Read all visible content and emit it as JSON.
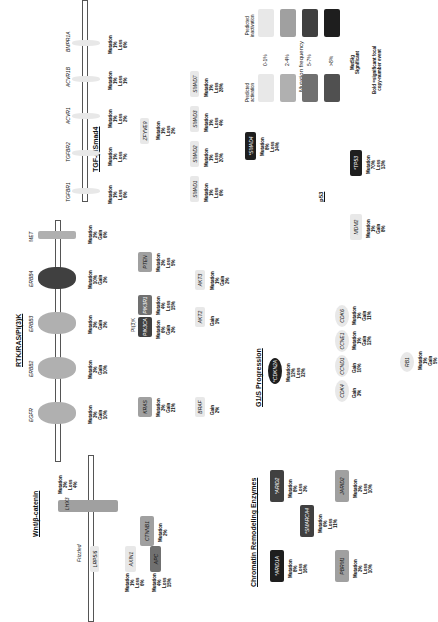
{
  "colors": {
    "c0": "#e8e8e8",
    "c1": "#b0b0b0",
    "c2": "#707070",
    "c3": "#1e1e1e",
    "bg": "#ffffff"
  },
  "tgf": {
    "title": "TGF-β/Smad4",
    "receptors": [
      {
        "name": "TGFBR1",
        "stat": "Mutation\n1%\nLoss\n6%"
      },
      {
        "name": "TGFBR2",
        "stat": "Mutation\n1%\nLoss\n7%"
      },
      {
        "name": "ACVR1",
        "stat": "Mutation\n1%\nLoss\n2%"
      },
      {
        "name": "ACVR1B",
        "stat": "Mutation\n1%\nLoss\n1%"
      },
      {
        "name": "BMPR1A",
        "stat": "Mutation\n1%\nLoss\n6%"
      }
    ],
    "zfyve9": {
      "name": "ZFYVE9",
      "stat": "Mutation\n1%\nLoss\n2%"
    },
    "smads": [
      {
        "name": "SMAD1",
        "stat": "Mutation\n1%\nLoss\n6%"
      },
      {
        "name": "SMAD2",
        "stat": "Mutation\n1%\nLoss\n20%"
      },
      {
        "name": "SMAD3",
        "stat": "Mutation\n1%\nLoss\n4%"
      },
      {
        "name": "SMAD7",
        "stat": "Mutation\n1%\nLoss\n28%"
      }
    ],
    "smad4": {
      "name": "*SMAD4",
      "stat": "Mutation\n8%\nLoss\n34%"
    }
  },
  "legend": {
    "title": "Mutation frequency",
    "left_label": "Predicted\nactivation",
    "right_label": "Predicted\ninactivation",
    "ranges": [
      "0-1%",
      "2-4%",
      "5-7%",
      ">8%"
    ],
    "star_note": "MutSig\nSignificant",
    "bold_note": "Bold =significant focal\ncopy-number event"
  },
  "p53": {
    "title": "p53",
    "mdm2": {
      "name": "MDM2",
      "stat": "Mutation\n1%\nGain\n8%"
    },
    "tp53": {
      "name": "*TP53",
      "stat": "Mutation\n70%\nLoss\n13%"
    }
  },
  "rtk": {
    "title": "RTK/RAS/PI(3)K",
    "receptors": [
      {
        "name": "MET",
        "stat": "Mutation\n2%\nGain\n6%"
      },
      {
        "name": "ERBB4",
        "stat": "Mutation\n10%\nGain\n2%"
      },
      {
        "name": "ERBB3",
        "stat": "Mutation\n3%\nGain\n2%"
      },
      {
        "name": "ERBB2",
        "stat": "Mutation\n3%\nGain\n10%"
      },
      {
        "name": "EGFR",
        "stat": "Mutation\n3%\nGain\n10%"
      }
    ],
    "pi3k_label": "PI(3)K",
    "pik3ca": {
      "name": "PIK3CA",
      "stat": "Mutation\n6%\nGain\n3%"
    },
    "pik3r1": {
      "name": "PIK3R1",
      "stat": "Mutation\n4%\nLoss\n15%"
    },
    "pten": {
      "name": "PTEN",
      "stat": "Mutation\n3%\nLoss\n5%"
    },
    "akt2": {
      "name": "AKT2",
      "stat": "Gain\n1%"
    },
    "akt3": {
      "name": "AKT3",
      "stat": "Mutation\n1%\nGain\n2%"
    },
    "kras": {
      "name": "KRAS",
      "stat": "Mutation\n3%\nGain\n21%"
    },
    "braf": {
      "name": "BRAF",
      "stat": "Gain\n2%"
    }
  },
  "g1s": {
    "title": "G1/S Progression",
    "cdkn2a": {
      "name": "*CDKN2A",
      "stat": "Mutation\n12%\nLoss\n32%"
    },
    "cdks": [
      {
        "name": "CDK6",
        "stat": "Mutation\n1%\nGain\n11%"
      },
      {
        "name": "CCNE1",
        "stat": "Mutation\n1%\nGain\n12%"
      },
      {
        "name": "CCND1",
        "stat": "Gain\n10%"
      },
      {
        "name": "CDK4",
        "stat": "Gain\n3%"
      }
    ],
    "rb1": {
      "name": "RB1",
      "stat": "Mutation\n1%\nGain\n5%"
    }
  },
  "wnt": {
    "title": "Wnt/β-catenin",
    "lhx": {
      "name": "LHX3",
      "stat": "Mutation\n3%\nLoss\n4%"
    },
    "frizzled": "Frizzled",
    "lrp": "LRP5/6",
    "ctnnb1": {
      "name": "CTNNB1",
      "stat": "Mutation\n2%"
    },
    "axin1": {
      "name": "AXIN1",
      "stat": "Mutation\n1%\nLoss\n6%"
    },
    "apc": {
      "name": "APC",
      "stat": "Mutation\n4%\nLoss\n15%"
    }
  },
  "chromatin": {
    "title": "Chromatin Remodeling Enzymes",
    "arid2": {
      "name": "*ARID2",
      "stat": "Mutation\n8%\nLoss\n3%"
    },
    "smarca4": {
      "name": "*SMARCA4",
      "stat": "Mutation\n6%\nLoss\n11%"
    },
    "arid1a": {
      "name": "*ARID1A",
      "stat": "Mutation\n8%\nLoss\n16%"
    },
    "jarid2": {
      "name": "JARID2",
      "stat": "Mutation\n3%\nLoss\n10%"
    },
    "pbrm1": {
      "name": "PBRM1",
      "stat": "Mutation\n3%\nLoss\n10%"
    }
  }
}
